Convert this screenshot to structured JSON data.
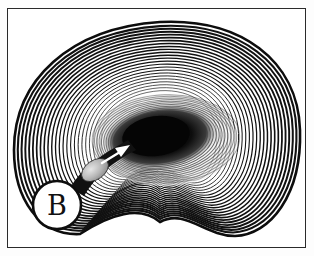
{
  "figure": {
    "label": "B",
    "colors": {
      "ink": "#111111",
      "paper": "#ffffff",
      "nucleus": "#0a0a0a",
      "fragment": "#b8b8b8",
      "arrow": "#ffffff",
      "frame": "#2a2a2a"
    },
    "lamellae_count": 24,
    "label_circle": {
      "cx": 57,
      "cy": 205,
      "r": 24
    }
  }
}
